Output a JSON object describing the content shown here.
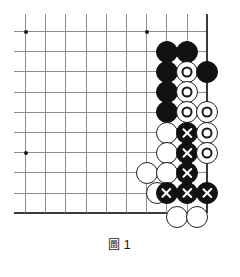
{
  "figure": {
    "caption_symbol": "圖",
    "caption_number": "1",
    "caption_full": "圖1"
  },
  "board": {
    "type": "go-board-diagram",
    "origin_x": 25.5,
    "origin_y": 31.5,
    "spacing": 20.2,
    "cols": 10,
    "rows": 10,
    "right_edge_col": 9,
    "bottom_edge_row": 9,
    "line_color": "#8d8d8d",
    "edge_color": "#3a3a3a",
    "black_color": "#111111",
    "white_color": "#ffffff",
    "star_points": [
      {
        "col": 0,
        "row": 0
      },
      {
        "col": 6,
        "row": 0
      },
      {
        "col": 0,
        "row": 6
      }
    ],
    "stones": [
      {
        "col": 7,
        "row": 1,
        "color": "black",
        "mark": ""
      },
      {
        "col": 8,
        "row": 1,
        "color": "black",
        "mark": ""
      },
      {
        "col": 7,
        "row": 2,
        "color": "black",
        "mark": ""
      },
      {
        "col": 8,
        "row": 2,
        "color": "white",
        "mark": "circle"
      },
      {
        "col": 9,
        "row": 2,
        "color": "black",
        "mark": ""
      },
      {
        "col": 7,
        "row": 3,
        "color": "black",
        "mark": ""
      },
      {
        "col": 8,
        "row": 3,
        "color": "white",
        "mark": "circle"
      },
      {
        "col": 7,
        "row": 4,
        "color": "black",
        "mark": ""
      },
      {
        "col": 8,
        "row": 4,
        "color": "white",
        "mark": "circle"
      },
      {
        "col": 9,
        "row": 4,
        "color": "white",
        "mark": "circle"
      },
      {
        "col": 7,
        "row": 5,
        "color": "white",
        "mark": ""
      },
      {
        "col": 8,
        "row": 5,
        "color": "black",
        "mark": "cross"
      },
      {
        "col": 9,
        "row": 5,
        "color": "white",
        "mark": "circle"
      },
      {
        "col": 7,
        "row": 6,
        "color": "white",
        "mark": ""
      },
      {
        "col": 8,
        "row": 6,
        "color": "black",
        "mark": "cross"
      },
      {
        "col": 9,
        "row": 6,
        "color": "white",
        "mark": "circle"
      },
      {
        "col": 6,
        "row": 7,
        "color": "white",
        "mark": ""
      },
      {
        "col": 7,
        "row": 7,
        "color": "white",
        "mark": ""
      },
      {
        "col": 8,
        "row": 7,
        "color": "black",
        "mark": "cross"
      },
      {
        "col": 6.5,
        "row": 8,
        "color": "white",
        "mark": ""
      },
      {
        "col": 7,
        "row": 8,
        "color": "black",
        "mark": "cross"
      },
      {
        "col": 8,
        "row": 8,
        "color": "black",
        "mark": "cross"
      },
      {
        "col": 9,
        "row": 8,
        "color": "black",
        "mark": "cross"
      },
      {
        "col": 7.5,
        "row": 9.2,
        "color": "white",
        "mark": ""
      },
      {
        "col": 8.5,
        "row": 9.2,
        "color": "white",
        "mark": ""
      }
    ]
  }
}
